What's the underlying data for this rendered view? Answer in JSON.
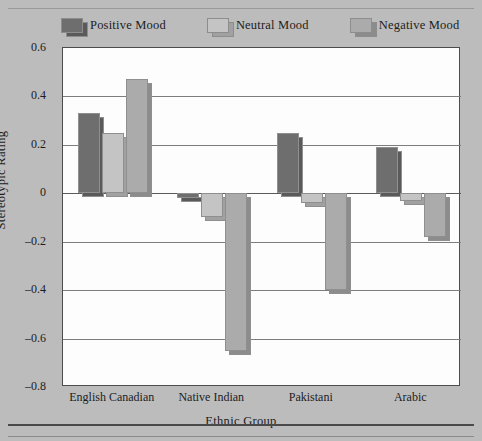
{
  "chart_data": {
    "type": "bar",
    "title": "",
    "xlabel": "Ethnic Group",
    "ylabel": "Stereotypic Rating",
    "categories": [
      "English Canadian",
      "Native Indian",
      "Pakistani",
      "Arabic"
    ],
    "series": [
      {
        "name": "Positive Mood",
        "color": "#6e6e6e",
        "values": [
          0.33,
          -0.02,
          0.25,
          0.19
        ]
      },
      {
        "name": "Neutral Mood",
        "color": "#c4c4c4",
        "values": [
          0.25,
          -0.1,
          -0.04,
          -0.03
        ]
      },
      {
        "name": "Negative Mood",
        "color": "#ababab",
        "values": [
          0.47,
          -0.65,
          -0.4,
          -0.18
        ]
      }
    ],
    "ylim": [
      -0.8,
      0.6
    ],
    "ytick_values": [
      0.6,
      0.4,
      0.2,
      0,
      -0.2,
      -0.4,
      -0.6,
      -0.8
    ],
    "ytick_labels": [
      "0.6",
      "0.4",
      "0.2",
      "0",
      "–0.2",
      "–0.4",
      "–0.6",
      "–0.8"
    ],
    "grid": true,
    "legend_position": "top",
    "background_color": "#bcbcbc",
    "plot_background_color": "#fdfdfd"
  }
}
